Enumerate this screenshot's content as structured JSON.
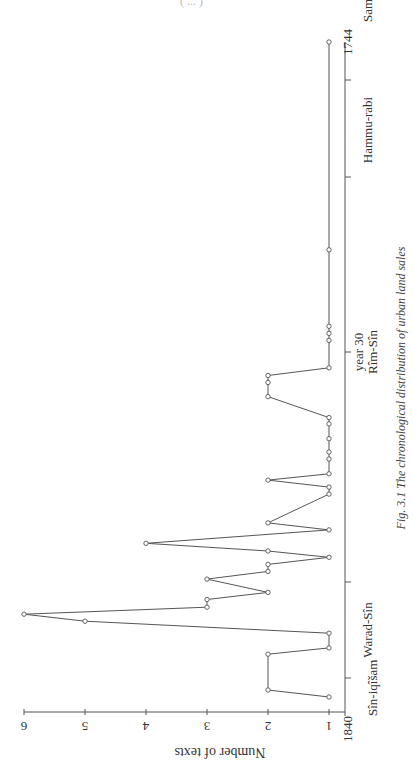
{
  "header_fragment": "( ... )",
  "chart_data": {
    "type": "line",
    "orientation": "rotated-90",
    "title": "Fig. 3.1 The chronological distribution of urban land sales",
    "caption_label": "Fig. 3.1",
    "caption_text": "The chronological distribution of urban land sales",
    "xlabel": "",
    "ylabel": "Number of texts",
    "xlim": [
      1840,
      1744
    ],
    "ylim": [
      1,
      6
    ],
    "yticks": [
      "1",
      "2",
      "3",
      "4",
      "5",
      "6"
    ],
    "x_tick_labels": {
      "start_year": "1840",
      "end_year": "1744",
      "year30": "year 30"
    },
    "reign_labels": [
      {
        "name": "Sîn-iqîšam",
        "position": "start"
      },
      {
        "name": "Warad-Sîn",
        "position": "between ticks 1-2"
      },
      {
        "name": "Rîm-Sîn",
        "position": "under year 30"
      },
      {
        "name": "Hammu-rabi",
        "position": "between ticks 4-5"
      },
      {
        "name": "Samsu-iluna",
        "position": "end"
      }
    ],
    "grid": false,
    "legend": null,
    "series": [
      {
        "name": "Number of texts",
        "points": [
          {
            "x": 1837.3,
            "y": 1
          },
          {
            "x": 1836.3,
            "y": 2
          },
          {
            "x": 1831.2,
            "y": 2
          },
          {
            "x": 1830.3,
            "y": 1
          },
          {
            "x": 1828.2,
            "y": 1
          },
          {
            "x": 1826.5,
            "y": 5
          },
          {
            "x": 1825.5,
            "y": 6
          },
          {
            "x": 1824.5,
            "y": 3
          },
          {
            "x": 1823.4,
            "y": 3
          },
          {
            "x": 1822.4,
            "y": 2
          },
          {
            "x": 1820.5,
            "y": 3
          },
          {
            "x": 1819.4,
            "y": 2
          },
          {
            "x": 1818.4,
            "y": 2
          },
          {
            "x": 1817.4,
            "y": 1
          },
          {
            "x": 1816.5,
            "y": 2
          },
          {
            "x": 1815.4,
            "y": 4
          },
          {
            "x": 1813.5,
            "y": 1
          },
          {
            "x": 1812.5,
            "y": 2
          },
          {
            "x": 1808.4,
            "y": 1
          },
          {
            "x": 1807.4,
            "y": 1
          },
          {
            "x": 1806.4,
            "y": 2
          },
          {
            "x": 1805.5,
            "y": 1
          },
          {
            "x": 1803.4,
            "y": 1
          },
          {
            "x": 1802.4,
            "y": 1
          },
          {
            "x": 1800.5,
            "y": 1
          },
          {
            "x": 1798.4,
            "y": 1
          },
          {
            "x": 1797.5,
            "y": 1
          },
          {
            "x": 1794.5,
            "y": 2
          },
          {
            "x": 1792.5,
            "y": 2
          },
          {
            "x": 1791.5,
            "y": 2
          },
          {
            "x": 1790.4,
            "y": 1
          },
          {
            "x": 1786.5,
            "y": 1
          },
          {
            "x": 1785.5,
            "y": 1
          },
          {
            "x": 1784.5,
            "y": 1
          },
          {
            "x": 1773.6,
            "y": 1
          },
          {
            "x": 1744.0,
            "y": 1
          }
        ]
      }
    ]
  }
}
